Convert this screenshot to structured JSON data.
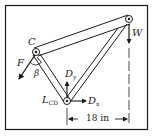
{
  "diagram": {
    "type": "mechanics-frame",
    "colors": {
      "ink": "#1a1a1a",
      "background": "#ffffff"
    },
    "points": {
      "C": {
        "label": "C"
      },
      "top_right": {
        "label": ""
      },
      "D": {
        "label": "L",
        "label_sub": "CD"
      }
    },
    "forces": {
      "F": {
        "label": "F"
      },
      "W": {
        "label": "W"
      },
      "Dx": {
        "label": "D",
        "label_sub": "x"
      },
      "Dy": {
        "label": "D",
        "label_sub": "y"
      }
    },
    "angle": {
      "label": "β"
    },
    "dimension": {
      "label": "18 in"
    }
  }
}
